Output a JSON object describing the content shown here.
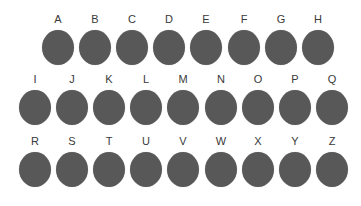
{
  "rows": [
    {
      "name": "row-1",
      "top": 13,
      "start_x": 42,
      "spacing": 37.1,
      "letters": [
        "A",
        "B",
        "C",
        "D",
        "E",
        "F",
        "G",
        "H"
      ]
    },
    {
      "name": "row-2",
      "top": 73,
      "start_x": 19,
      "spacing": 37.1,
      "letters": [
        "I",
        "J",
        "K",
        "L",
        "M",
        "N",
        "O",
        "P",
        "Q"
      ]
    },
    {
      "name": "row-3",
      "top": 135,
      "start_x": 19,
      "spacing": 37.1,
      "letters": [
        "R",
        "S",
        "T",
        "U",
        "V",
        "W",
        "X",
        "Y",
        "Z"
      ]
    }
  ],
  "colors": {
    "circle": "#585858",
    "label": "#3a3a3a",
    "background": "#ffffff"
  }
}
